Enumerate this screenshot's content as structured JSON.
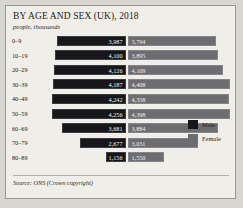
{
  "figure": {
    "title": "BY AGE AND SEX (UK), 2018",
    "subtitle": "people, thousands",
    "source": "Source: ONS (Crown copyright)"
  },
  "legend": {
    "male_label": "Male",
    "female_label": "Female",
    "male_color": "#17161a",
    "female_color": "#6d6c70"
  },
  "chart_data": {
    "type": "bar",
    "title": "BY AGE AND SEX (UK), 2018",
    "subtitle": "people, thousands",
    "xlabel": "",
    "ylabel": "",
    "orientation": "horizontal-diverging",
    "grid": false,
    "legend_position": "right",
    "categories": [
      "0–9",
      "10–19",
      "20–29",
      "30–39",
      "40–49",
      "50–59",
      "60–69",
      "70–79",
      "80–89"
    ],
    "series": [
      {
        "name": "Male",
        "color": "#17161a",
        "direction": "left",
        "values": [
          3987,
          4100,
          4126,
          4187,
          4242,
          4256,
          3681,
          2677,
          1156
        ],
        "labels": [
          "3,987",
          "4,100",
          "4,126",
          "4,187",
          "4,242",
          "4,256",
          "3,681",
          "2,677",
          "1,156"
        ]
      },
      {
        "name": "Female",
        "color": "#6d6c70",
        "direction": "right",
        "values": [
          3794,
          3895,
          4109,
          4408,
          4358,
          4398,
          3884,
          3031,
          1550
        ],
        "labels": [
          "3,794",
          "3,895",
          "4,109",
          "4,408",
          "4,358",
          "4,398",
          "3,884",
          "3,031",
          "1,550"
        ]
      }
    ],
    "xlim": [
      0,
      4500
    ],
    "source": "Source: ONS (Crown copyright)"
  }
}
